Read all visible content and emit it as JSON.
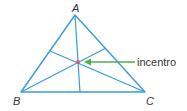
{
  "diagram": {
    "vertices": [
      {
        "name": "A",
        "x": 75,
        "y": 15,
        "label_x": 72,
        "label_y": 12
      },
      {
        "name": "B",
        "x": 21,
        "y": 92,
        "label_x": 13,
        "label_y": 105
      },
      {
        "name": "C",
        "x": 145,
        "y": 92,
        "label_x": 146,
        "label_y": 105
      }
    ],
    "incenter": {
      "x": 78,
      "y": 62,
      "color": "#e05a6a"
    },
    "bisector_feet": {
      "on_AB": {
        "x": 50,
        "y": 51
      },
      "on_AC": {
        "x": 106,
        "y": 48
      },
      "on_BC": {
        "x": 80,
        "y": 92
      }
    },
    "annotation": {
      "label": "incentro",
      "arrow_from_x": 135,
      "arrow_to_x": 85,
      "y": 62,
      "label_x": 137,
      "label_y": 66
    },
    "colors": {
      "triangle": "#3a9ad9",
      "arrow": "#4caf50",
      "text": "#333333"
    }
  }
}
